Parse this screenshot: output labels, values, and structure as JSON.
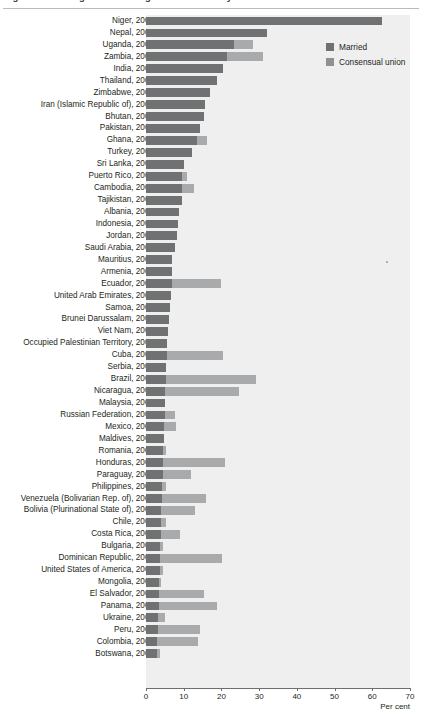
{
  "title": {
    "text": "Figure: Percentage of women aged 15-19 currently married or in union",
    "clipped": true
  },
  "legend": {
    "position": "top-right",
    "entries": [
      {
        "label": "Married",
        "color": "#6f7173",
        "icon": "legend-swatch"
      },
      {
        "label": "Consensual union",
        "color": "#8e9092",
        "icon": "legend-swatch"
      }
    ]
  },
  "axis": {
    "title": "Per cent",
    "ticks": [
      "0",
      "10",
      "20",
      "30",
      "40",
      "50",
      "60",
      "70"
    ]
  },
  "chart_data": {
    "type": "bar",
    "orientation": "horizontal",
    "stacked": true,
    "title": "Percentage of women aged 15-19 currently married or in union",
    "xlabel": "Per cent",
    "ylabel": "",
    "xlim": [
      0,
      70
    ],
    "grid": false,
    "legend_position": "top-right",
    "categories": [
      "Niger, 2001",
      "Nepal, 2001",
      "Uganda, 2002",
      "Zambia, 2000",
      "India, 2001",
      "Thailand, 2005",
      "Zimbabwe, 2002",
      "Iran (Islamic Republic of), 2006",
      "Bhutan, 2005",
      "Pakistan, 2000",
      "Ghana, 2000",
      "Turkey, 2000",
      "Sri Lanka, 2001",
      "Puerto Rico, 2000",
      "Cambodia, 2004",
      "Tajikistan, 2000",
      "Albania, 2001",
      "Indonesia, 2005",
      "Jordan, 2004",
      "Saudi Arabia, 2004",
      "Mauritius, 2000",
      "Armenia, 2001",
      "Ecuador, 2001",
      "United Arab Emirates, 2005",
      "Samoa, 2001",
      "Brunei Darussalam, 2001",
      "Viet Nam, 2008",
      "Occupied Palestinian Territory, 2007",
      "Cuba, 2002",
      "Serbia, 2002",
      "Brazil, 2000",
      "Nicaragua, 2005",
      "Malaysia, 2000",
      "Russian Federation,  2002",
      "Mexico, 2008",
      "Maldives, 2006",
      "Romania, 2008",
      "Honduras, 2001",
      "Paraguay, 2002",
      "Philippines, 2000",
      "Venezuela (Bolivarian Rep. of), 2001",
      "Bolivia (Plurinational State of), 2001",
      "Chile, 2002",
      "Costa Rica, 2007",
      "Bulgaria, 2001",
      "Dominican Republic, 2002",
      "United States of America, 2000",
      "Mongolia, 2000",
      "El Salvador, 2007",
      "Panama, 2000",
      "Ukraine, 2001",
      "Peru, 2007",
      "Colombia, 2005",
      "Botswana, 2001"
    ],
    "series": [
      {
        "name": "Married",
        "color": "#6f7173",
        "values": [
          62.5,
          32.0,
          23.3,
          21.5,
          20.3,
          18.8,
          17.0,
          15.7,
          15.4,
          14.2,
          13.4,
          12.3,
          10.0,
          9.6,
          9.6,
          9.5,
          8.7,
          8.5,
          8.2,
          7.8,
          7.0,
          6.9,
          6.8,
          6.6,
          6.3,
          6.0,
          5.8,
          5.6,
          5.5,
          5.4,
          5.2,
          5.1,
          5.1,
          5.0,
          4.8,
          4.7,
          4.6,
          4.6,
          4.5,
          4.3,
          4.2,
          4.1,
          3.9,
          3.9,
          3.7,
          3.6,
          3.6,
          3.5,
          3.5,
          3.4,
          3.3,
          3.2,
          3.0,
          2.9
        ]
      },
      {
        "name": "Consensual union",
        "color": "#a8aaac",
        "values": [
          0.0,
          0.0,
          5.0,
          9.6,
          0.0,
          0.0,
          0.0,
          0.0,
          0.0,
          0.0,
          2.7,
          0.0,
          0.0,
          1.2,
          3.0,
          0.0,
          0.0,
          0.0,
          0.0,
          0.0,
          0.0,
          0.0,
          13.2,
          0.0,
          0.0,
          0.0,
          0.0,
          0.0,
          15.0,
          0.0,
          24.0,
          19.5,
          0.0,
          2.7,
          3.1,
          0.0,
          0.6,
          16.4,
          7.3,
          1.0,
          11.6,
          8.9,
          1.4,
          5.2,
          0.7,
          16.6,
          1.0,
          0.5,
          11.9,
          15.4,
          1.8,
          11.0,
          10.8,
          0.8
        ]
      }
    ]
  }
}
